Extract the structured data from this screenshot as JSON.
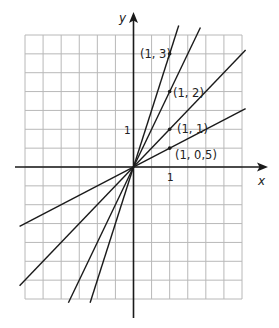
{
  "chart_data": {
    "type": "line",
    "title": "",
    "xlabel": "x",
    "ylabel": "y",
    "grid": true,
    "grid_cell_units": 0.5,
    "xlim": [
      -3,
      3
    ],
    "ylim": [
      -3.5,
      3.5
    ],
    "x_ticks": [
      {
        "value": 1,
        "label": "1"
      }
    ],
    "y_ticks": [
      {
        "value": 1,
        "label": "1"
      }
    ],
    "series": [
      {
        "name": "y = 3x",
        "slope": 3,
        "point": [
          1,
          3
        ],
        "label": "(1, 3)",
        "x": [
          -1.2,
          0,
          1.25
        ],
        "y": [
          -3.6,
          0,
          3.75
        ]
      },
      {
        "name": "y = 2x",
        "slope": 2,
        "point": [
          1,
          2
        ],
        "label": "(1, 2)",
        "x": [
          -1.8,
          0,
          1.85
        ],
        "y": [
          -3.6,
          0,
          3.7
        ]
      },
      {
        "name": "y = x",
        "slope": 1,
        "point": [
          1,
          1
        ],
        "label": "(1, 1)",
        "x": [
          -3.15,
          0,
          3.1
        ],
        "y": [
          -3.15,
          0,
          3.1
        ]
      },
      {
        "name": "y = 0.5x",
        "slope": 0.5,
        "point": [
          1,
          0.5
        ],
        "label": "(1, 0,5)",
        "x": [
          -3.15,
          0,
          3.1
        ],
        "y": [
          -1.575,
          0,
          1.55
        ]
      }
    ],
    "annotations": [
      "(1, 3)",
      "(1, 2)",
      "(1, 1)",
      "(1, 0,5)"
    ]
  },
  "axes": {
    "x_label": "x",
    "y_label": "y",
    "x_tick_label": "1",
    "y_tick_label": "1"
  },
  "labels": {
    "p3": "(1, 3)",
    "p2": "(1, 2)",
    "p1": "(1, 1)",
    "p05": "(1, 0,5)"
  }
}
